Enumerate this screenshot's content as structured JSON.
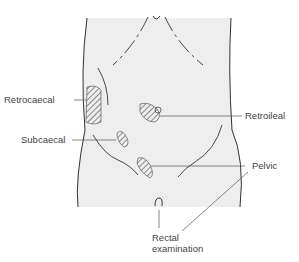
{
  "diagram": {
    "colors": {
      "body_fill": "#eeeeee",
      "outline": "#333333",
      "hatch": "#444444",
      "leader": "#555555"
    },
    "labels": {
      "retrocaecal": "Retrocaecal",
      "retroileal": "Retroileal",
      "subcaecal": "Subcaecal",
      "pelvic": "Pelvic",
      "rectal_line1": "Rectal",
      "rectal_line2": "examination"
    }
  }
}
